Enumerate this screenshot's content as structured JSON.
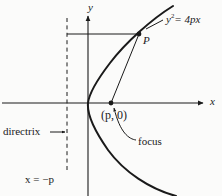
{
  "figure": {
    "kind": "parabola-geometry-diagram",
    "background_color": "#fbfbfa",
    "ink_color": "#1a1a1a",
    "axes": {
      "y_axis_label": "y",
      "x_axis_label": "x",
      "origin_px": [
        88,
        103
      ],
      "x_axis_span_px": [
        2,
        206
      ],
      "y_axis_span_px": [
        14,
        196
      ]
    },
    "labels": {
      "equation": "= 4px",
      "equation_base": "y",
      "equation_exponent": "2",
      "point_p": "P",
      "focus_coordinate": "(p, 0)",
      "directrix": "directrix",
      "directrix_arrow": "→",
      "focus": "focus",
      "directrix_equation": "x = −p"
    },
    "markers": {
      "focus_point_px": [
        111,
        103
      ],
      "point_p_px": [
        139,
        34
      ]
    },
    "directrix_line": {
      "x_px": 67,
      "y_from_px": 18,
      "y_to_px": 172,
      "style": "dashed"
    },
    "curve": {
      "name": "parabola",
      "vertex_px": [
        88,
        103
      ],
      "opens": "right"
    }
  }
}
